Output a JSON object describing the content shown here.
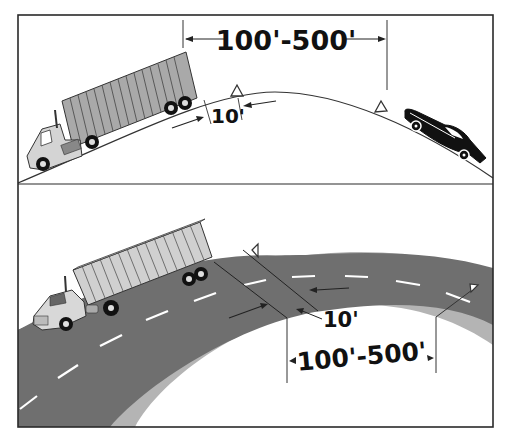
{
  "figure": {
    "top_panel": {
      "distance_label": "100'-500'",
      "gap_label": "10'",
      "vehicles": [
        "tractor-trailer truck climbing hill",
        "car descending hill"
      ],
      "warning_devices": 2
    },
    "bottom_panel": {
      "distance_label": "100'-500'",
      "gap_label": "10'",
      "vehicles": [
        "tractor-trailer truck stopped on curve"
      ],
      "warning_devices": 2
    },
    "colors": {
      "frame": "#2a2a2a",
      "road": "#6f6f6f",
      "shoulder": "#b4b4b4",
      "trailer": "#a9a9a9",
      "cab": "#d8d8d8",
      "lane_marking": "#ffffff",
      "car": "#111111"
    }
  }
}
